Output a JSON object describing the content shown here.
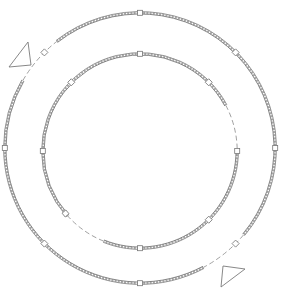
{
  "diagram": {
    "type": "technical-line-drawing",
    "colors": {
      "background": "#ffffff",
      "line": "#8a8a8a",
      "hatch": "#a8a8a8"
    },
    "outer_ring": {
      "cx": 140,
      "cy": 148,
      "r": 134,
      "gaps_deg": [
        [
          -150,
          -128
        ],
        [
          40,
          62
        ]
      ],
      "marker_angles_deg": [
        -90,
        -45,
        -135,
        0,
        180,
        90,
        45,
        135
      ]
    },
    "inner_ring": {
      "cx": 140,
      "cy": 151,
      "r": 96,
      "gaps_deg": [
        [
          -28,
          0
        ],
        [
          112,
          138
        ]
      ],
      "marker_angles_deg": [
        -90,
        -45,
        -135,
        0,
        180,
        90,
        45,
        140
      ]
    },
    "triangles": [
      {
        "name": "direction-marker-top-left",
        "points": [
          [
            9,
            67
          ],
          [
            28,
            42
          ],
          [
            31,
            65
          ]
        ]
      },
      {
        "name": "direction-marker-bottom-right",
        "points": [
          [
            223,
            266
          ],
          [
            245,
            269
          ],
          [
            221,
            287
          ]
        ]
      }
    ]
  }
}
